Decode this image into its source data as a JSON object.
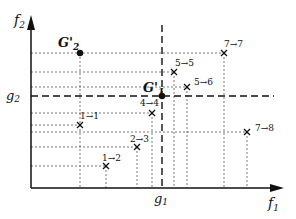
{
  "diagram": {
    "axes": {
      "x_label": "f",
      "x_label_sub": "1",
      "y_label": "f",
      "y_label_sub": "2",
      "x_threshold_label": "g",
      "x_threshold_sub": "1",
      "y_threshold_label": "g",
      "y_threshold_sub": "2"
    },
    "reference_points": [
      {
        "label": "G'",
        "sub": "2",
        "x": 80,
        "y": 53
      },
      {
        "label": "G'",
        "sub": "1",
        "x": 162,
        "y": 96
      }
    ],
    "points": [
      {
        "label": "7→7",
        "x": 224,
        "y": 53
      },
      {
        "label": "5→5",
        "x": 174,
        "y": 72
      },
      {
        "label": "5→6",
        "x": 187,
        "y": 87
      },
      {
        "label": "4→4",
        "x": 152,
        "y": 113
      },
      {
        "label": "1→1",
        "x": 80,
        "y": 125
      },
      {
        "label": "7→8",
        "x": 247,
        "y": 132
      },
      {
        "label": "2→3",
        "x": 137,
        "y": 147
      },
      {
        "label": "1→2",
        "x": 106,
        "y": 166
      }
    ]
  }
}
